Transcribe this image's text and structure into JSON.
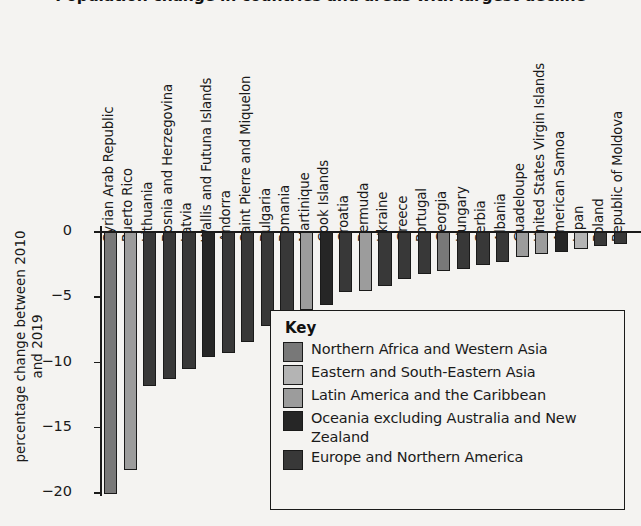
{
  "chart_data": {
    "type": "bar",
    "title": "Population change in countries and areas with largest decline",
    "xlabel": "",
    "ylabel": "percentage change between 2010 and 2019",
    "ylim": [
      -20.5,
      0
    ],
    "yticks": [
      0,
      -5,
      -10,
      -15,
      -20
    ],
    "ytick_labels": [
      "0",
      "−5",
      "−10",
      "−15",
      "−20"
    ],
    "grid": false,
    "legend_position": "inside-lower-right",
    "categories": [
      "Syrian Arab Republic",
      "Puerto Rico",
      "Lithuania",
      "Bosnia and Herzegovina",
      "Latvia",
      "Wallis and Futuna Islands",
      "Andorra",
      "Saint Pierre and Miquelon",
      "Bulgaria",
      "Romania",
      "Martinique",
      "Cook Islands",
      "Croatia",
      "Bermuda",
      "Ukraine",
      "Greece",
      "Portugal",
      "Georgia",
      "Hungary",
      "Serbia",
      "Albania",
      "Guadeloupe",
      "United States Virgin Islands",
      "American Samoa",
      "Japan",
      "Poland",
      "Republic of Moldova"
    ],
    "values": [
      -20.1,
      -18.2,
      -11.8,
      -11.3,
      -10.5,
      -9.6,
      -9.3,
      -8.4,
      -7.2,
      -6.3,
      -6.0,
      -5.6,
      -4.6,
      -4.5,
      -4.1,
      -3.6,
      -3.2,
      -3.0,
      -2.8,
      -2.5,
      -2.3,
      -1.9,
      -1.7,
      -1.5,
      -1.3,
      -1.1,
      -0.9
    ],
    "groups": [
      "northern-africa-western-asia",
      "latin-america-caribbean",
      "europe-northern-america",
      "europe-northern-america",
      "europe-northern-america",
      "oceania-excluding-australia-new-zealand",
      "europe-northern-america",
      "europe-northern-america",
      "europe-northern-america",
      "europe-northern-america",
      "latin-america-caribbean",
      "oceania-excluding-australia-new-zealand",
      "europe-northern-america",
      "latin-america-caribbean",
      "europe-northern-america",
      "europe-northern-america",
      "europe-northern-america",
      "northern-africa-western-asia",
      "europe-northern-america",
      "europe-northern-america",
      "europe-northern-america",
      "latin-america-caribbean",
      "latin-america-caribbean",
      "oceania-excluding-australia-new-zealand",
      "eastern-south-eastern-asia",
      "europe-northern-america",
      "europe-northern-america"
    ],
    "group_colors": {
      "northern-africa-western-asia": "#787878",
      "eastern-south-eastern-asia": "#b4b4b4",
      "latin-america-caribbean": "#9c9c9c",
      "oceania-excluding-australia-new-zealand": "#262626",
      "europe-northern-america": "#383838"
    }
  },
  "legend": {
    "title": "Key",
    "items": [
      {
        "label": "Northern Africa and Western Asia",
        "color": "#787878"
      },
      {
        "label": "Eastern and South-Eastern Asia",
        "color": "#b4b4b4"
      },
      {
        "label": "Latin America and the Caribbean",
        "color": "#9c9c9c"
      },
      {
        "label": "Oceania excluding Australia and New Zealand",
        "color": "#262626"
      },
      {
        "label": "Europe and Northern America",
        "color": "#383838"
      }
    ]
  }
}
